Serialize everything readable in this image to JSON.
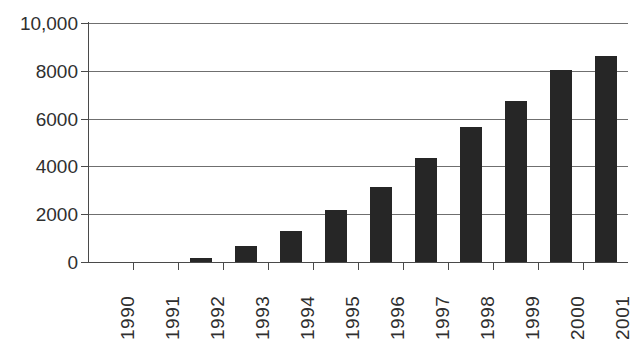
{
  "chart_data": {
    "type": "bar",
    "title": "",
    "subtitle": "",
    "xlabel": "",
    "ylabel": "",
    "categories": [
      "1990",
      "1991",
      "1992",
      "1993",
      "1994",
      "1995",
      "1996",
      "1997",
      "1998",
      "1999",
      "2000",
      "2001"
    ],
    "values": [
      0,
      0,
      150,
      680,
      1280,
      2180,
      3120,
      4360,
      5650,
      6750,
      8020,
      8600
    ],
    "series": [
      {
        "name": "",
        "values": [
          0,
          0,
          150,
          680,
          1280,
          2180,
          3120,
          4360,
          5650,
          6750,
          8020,
          8600
        ]
      }
    ],
    "ylim": [
      0,
      10000
    ],
    "y_ticks": [
      0,
      2000,
      4000,
      6000,
      8000,
      10000
    ],
    "y_tick_labels": [
      "0",
      "2000",
      "4000",
      "6000",
      "8000",
      "10,000"
    ],
    "grid": true,
    "grid_axis": "y",
    "legend": false,
    "legend_position": "none",
    "bar_color": "#262626",
    "grid_color": "#6f6f6f",
    "axis_color": "#4a4a4a",
    "text_color": "#2f2f2f",
    "background_color": "#ffffff",
    "x_tick_label_rotation": 90,
    "annotations": []
  }
}
